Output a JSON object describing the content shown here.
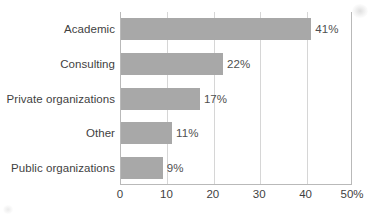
{
  "chart_data": {
    "type": "bar",
    "orientation": "horizontal",
    "title": "",
    "subtitle": "",
    "xlabel": "",
    "ylabel": "",
    "categories": [
      "Academic",
      "Consulting",
      "Private organizations",
      "Other",
      "Public organizations"
    ],
    "values": [
      41,
      22,
      17,
      11,
      9
    ],
    "data_labels": [
      "41%",
      "22%",
      "17%",
      "11%",
      "9%"
    ],
    "xlim": [
      0,
      50
    ],
    "xticks": [
      0,
      10,
      20,
      30,
      40,
      50
    ],
    "xtick_labels": [
      "0",
      "10",
      "20",
      "30",
      "40",
      "50%"
    ],
    "grid": true,
    "gridlines_at": [
      10,
      20,
      30,
      40
    ],
    "legend": null,
    "legend_position": "none",
    "bar_color": "#a8a8a8",
    "grid_color": "#d6d6d6",
    "axis_color": "#b9b9b9",
    "text_color": "#3f3f3f"
  }
}
